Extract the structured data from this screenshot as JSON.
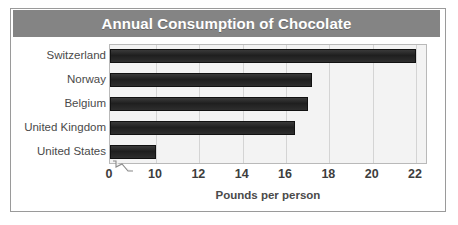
{
  "chart_data": {
    "type": "bar",
    "orientation": "horizontal",
    "title": "Annual Consumption of Chocolate",
    "xlabel": "Pounds per person",
    "ylabel": "",
    "categories": [
      "Switzerland",
      "Norway",
      "Belgium",
      "United Kingdom",
      "United States"
    ],
    "values": [
      22.0,
      17.2,
      17.0,
      16.4,
      10.0
    ],
    "xlim": [
      0,
      23
    ],
    "xticks": [
      0,
      10,
      12,
      14,
      16,
      18,
      20,
      22
    ],
    "xtick_labels": [
      "0",
      "10",
      "12",
      "14",
      "16",
      "18",
      "20",
      "22"
    ],
    "axis_break": true,
    "axis_break_between": [
      0,
      10
    ],
    "grid": true,
    "grid_axis": "x",
    "legend": false,
    "legend_position": "none",
    "colors": {
      "bar": "#262626",
      "bar_edge": "#111111",
      "plot_background": "#f3f3f3",
      "gridline": "#d4d4d4",
      "title_banner": "#848484",
      "title_text": "#ffffff",
      "label_text": "#4a4a4a",
      "tick_text": "#3d3d3d",
      "frame_border": "#9a9a9a",
      "plot_border": "#b9b9b9",
      "page_background": "#ffffff"
    }
  },
  "title_banner": {
    "text": "Annual Consumption of Chocolate"
  },
  "axis": {
    "x_title": "Pounds per person"
  }
}
